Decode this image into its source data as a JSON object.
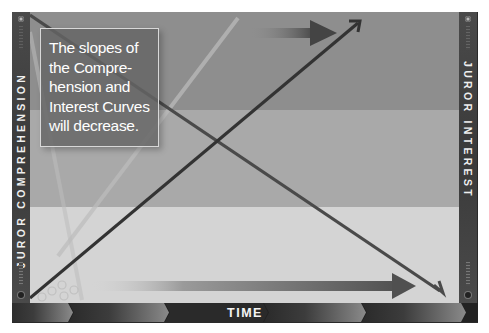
{
  "diagram": {
    "title_box": {
      "lines": [
        "The slopes of",
        "the Compre-",
        "hension and",
        "Interest Curves",
        "will decrease."
      ]
    },
    "axes": {
      "left_label": "JUROR COMPREHENSION",
      "right_label": "JUROR INTEREST",
      "bottom_label": "TIME"
    },
    "curves": [
      {
        "name": "Juror Comprehension",
        "direction": "rising",
        "from": [
          30,
          298
        ],
        "to": [
          360,
          22
        ],
        "color": "#3a3a3a"
      },
      {
        "name": "Juror Interest",
        "direction": "falling",
        "from": [
          30,
          15
        ],
        "to": [
          443,
          293
        ],
        "color": "#4a4a4a"
      }
    ],
    "arrows": [
      {
        "name": "upper-time-arrow",
        "from_x": 250,
        "to_x": 335,
        "y": 33
      },
      {
        "name": "lower-time-arrow",
        "from_x": 90,
        "to_x": 415,
        "y": 286
      }
    ],
    "bands": {
      "top": "#8e8e8e",
      "middle": "#a9a9a9",
      "bottom": "#d4d4d4"
    },
    "colors": {
      "frame": "#2a2a2a",
      "text": "#ffffff"
    }
  }
}
